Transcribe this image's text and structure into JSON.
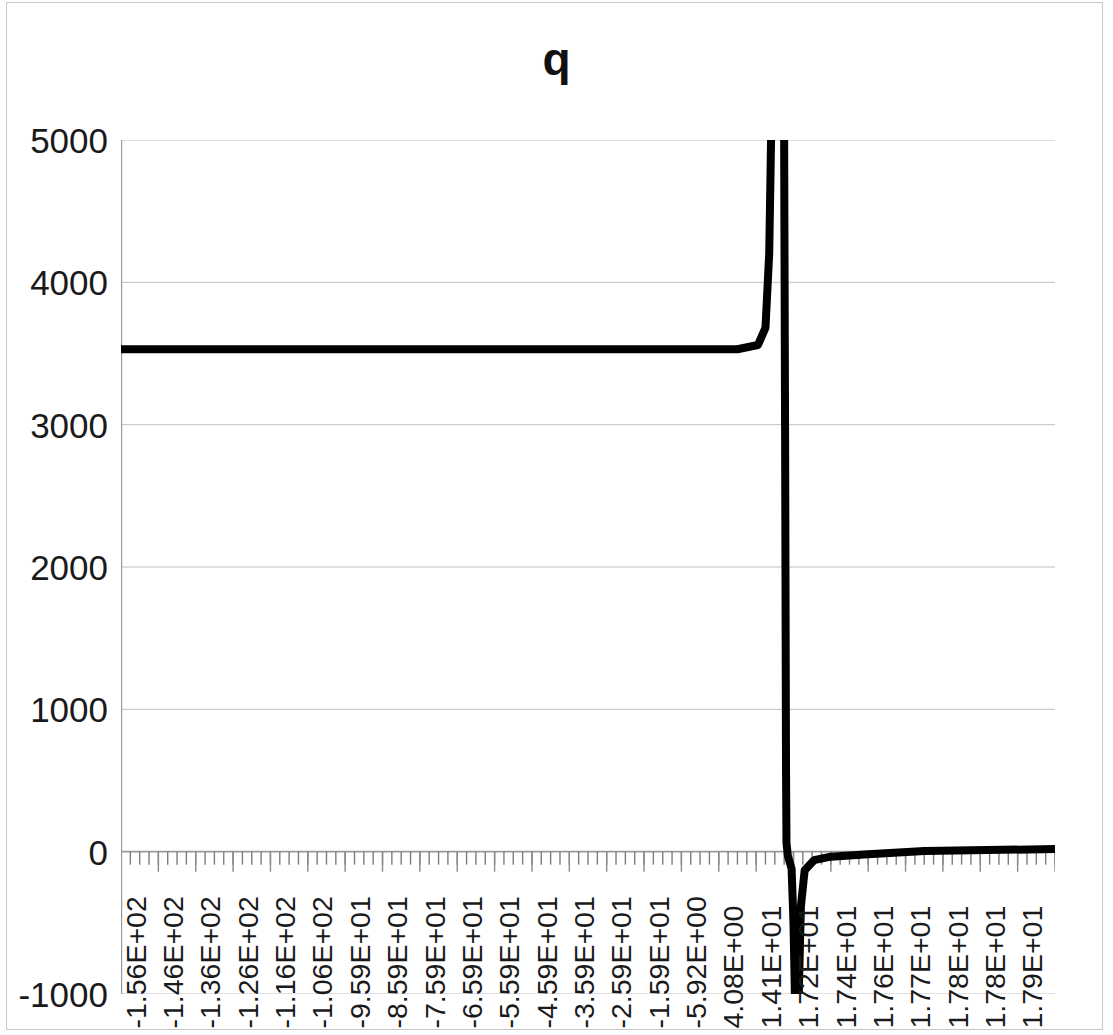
{
  "chart_data": {
    "type": "line",
    "title": "q",
    "xlabel": "",
    "ylabel": "",
    "grid": true,
    "legend": false,
    "legend_position": "none",
    "series_color": "#000000",
    "gridline_color": "#c0c0c0",
    "axis_color": "#9a9a9a",
    "background_color": "#ffffff",
    "ylim": [
      -1000,
      5000
    ],
    "ytick_labels": [
      "5000",
      "4000",
      "3000",
      "2000",
      "1000",
      "0",
      "-1000"
    ],
    "yticks": [
      5000,
      4000,
      3000,
      2000,
      1000,
      0,
      -1000
    ],
    "xtick_labels": [
      "-1.56E+02",
      "-1.46E+02",
      "-1.36E+02",
      "-1.26E+02",
      "-1.16E+02",
      "-1.06E+02",
      "-9.59E+01",
      "-8.59E+01",
      "-7.59E+01",
      "-6.59E+01",
      "-5.59E+01",
      "-4.59E+01",
      "-3.59E+01",
      "-2.59E+01",
      "-1.59E+01",
      "-5.92E+00",
      "4.08E+00",
      "1.41E+01",
      "1.72E+01",
      "1.74E+01",
      "1.76E+01",
      "1.77E+01",
      "1.78E+01",
      "1.78E+01",
      "1.79E+01"
    ],
    "xtick_values": [
      -156,
      -146,
      -136,
      -126,
      -116,
      -106,
      -95.9,
      -85.9,
      -75.9,
      -65.9,
      -55.9,
      -45.9,
      -35.9,
      -25.9,
      -15.9,
      -5.92,
      4.08,
      14.1,
      17.2,
      17.4,
      17.6,
      17.7,
      17.8,
      17.8,
      17.9
    ],
    "x_minor_ticks": true,
    "series": [
      {
        "name": "q",
        "comment": "Plateau near 3530 for most of the negative domain, a sharp asymptotic pole near x = 1.7E+01 running off the top of the axis, a deep negative spike immediately after, then an almost-zero tail.",
        "points": [
          {
            "x": 0.0,
            "y": 3530
          },
          {
            "x": 0.66,
            "y": 3530
          },
          {
            "x": 0.682,
            "y": 3560
          },
          {
            "x": 0.69,
            "y": 3680
          },
          {
            "x": 0.694,
            "y": 4200
          },
          {
            "x": 0.696,
            "y": 5000
          },
          {
            "x": 0.697,
            "y": 9000
          },
          {
            "x": 0.709,
            "y": 9000
          },
          {
            "x": 0.71,
            "y": 5000
          },
          {
            "x": 0.711,
            "y": 3000
          },
          {
            "x": 0.712,
            "y": 600
          },
          {
            "x": 0.7125,
            "y": 60
          },
          {
            "x": 0.714,
            "y": -30
          },
          {
            "x": 0.718,
            "y": -120
          },
          {
            "x": 0.72,
            "y": -500
          },
          {
            "x": 0.7215,
            "y": -1000
          },
          {
            "x": 0.7225,
            "y": -1400
          },
          {
            "x": 0.7245,
            "y": -1400
          },
          {
            "x": 0.726,
            "y": -900
          },
          {
            "x": 0.728,
            "y": -380
          },
          {
            "x": 0.732,
            "y": -130
          },
          {
            "x": 0.742,
            "y": -60
          },
          {
            "x": 0.76,
            "y": -35
          },
          {
            "x": 0.8,
            "y": -18
          },
          {
            "x": 0.86,
            "y": 5
          },
          {
            "x": 1.0,
            "y": 18
          }
        ]
      }
    ]
  }
}
